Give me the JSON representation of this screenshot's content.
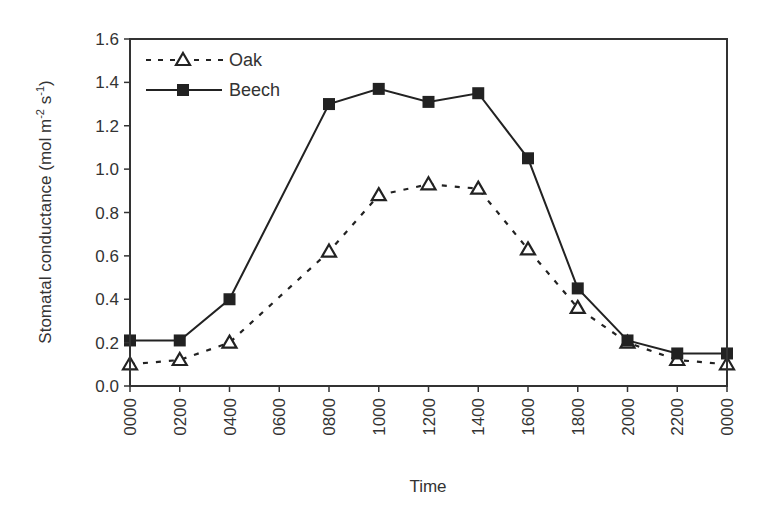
{
  "chart_data": {
    "type": "line",
    "title": "",
    "xlabel": "Time",
    "ylabel": "Stomatal conductance (mol m-2 s-1)",
    "ylabel_parts": {
      "main": "Stomatal conductance (mol m",
      "exp1": "-2",
      "mid": " s",
      "exp2": "-1",
      "end": ")"
    },
    "ylim": [
      0.0,
      1.6
    ],
    "yticks": [
      "0.0",
      "0.2",
      "0.4",
      "0.6",
      "0.8",
      "1.0",
      "1.2",
      "1.4",
      "1.6"
    ],
    "categories": [
      "0000",
      "0200",
      "0400",
      "0600",
      "0800",
      "1000",
      "1200",
      "1400",
      "1600",
      "1800",
      "2000",
      "2200",
      "0000"
    ],
    "grid": false,
    "legend_position": "top-left inside",
    "series": [
      {
        "name": "Oak",
        "line_style": "dashed",
        "marker": "open-triangle",
        "values": [
          0.1,
          0.12,
          0.2,
          null,
          0.62,
          0.88,
          0.93,
          0.91,
          0.63,
          0.36,
          0.2,
          0.12,
          0.1
        ]
      },
      {
        "name": "Beech",
        "line_style": "solid",
        "marker": "filled-square",
        "values": [
          0.21,
          0.21,
          0.4,
          null,
          1.3,
          1.37,
          1.31,
          1.35,
          1.05,
          0.45,
          0.21,
          0.15,
          0.15
        ]
      }
    ]
  },
  "colors": {
    "line": "#222222",
    "axis": "#333333",
    "text": "#333333",
    "background": "#ffffff"
  }
}
